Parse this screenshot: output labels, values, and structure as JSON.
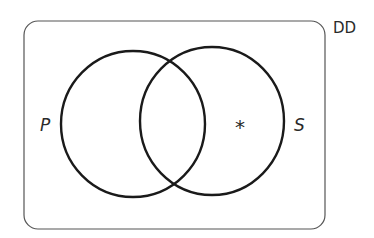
{
  "diagram": {
    "type": "venn",
    "universe_label": "DD",
    "sets": [
      {
        "label": "P",
        "position": "left"
      },
      {
        "label": "S",
        "position": "right"
      }
    ],
    "marks": [
      {
        "symbol": "*",
        "region": "S only"
      }
    ],
    "colors": {
      "stroke": "#1a1a1a",
      "background": "#ffffff"
    }
  }
}
